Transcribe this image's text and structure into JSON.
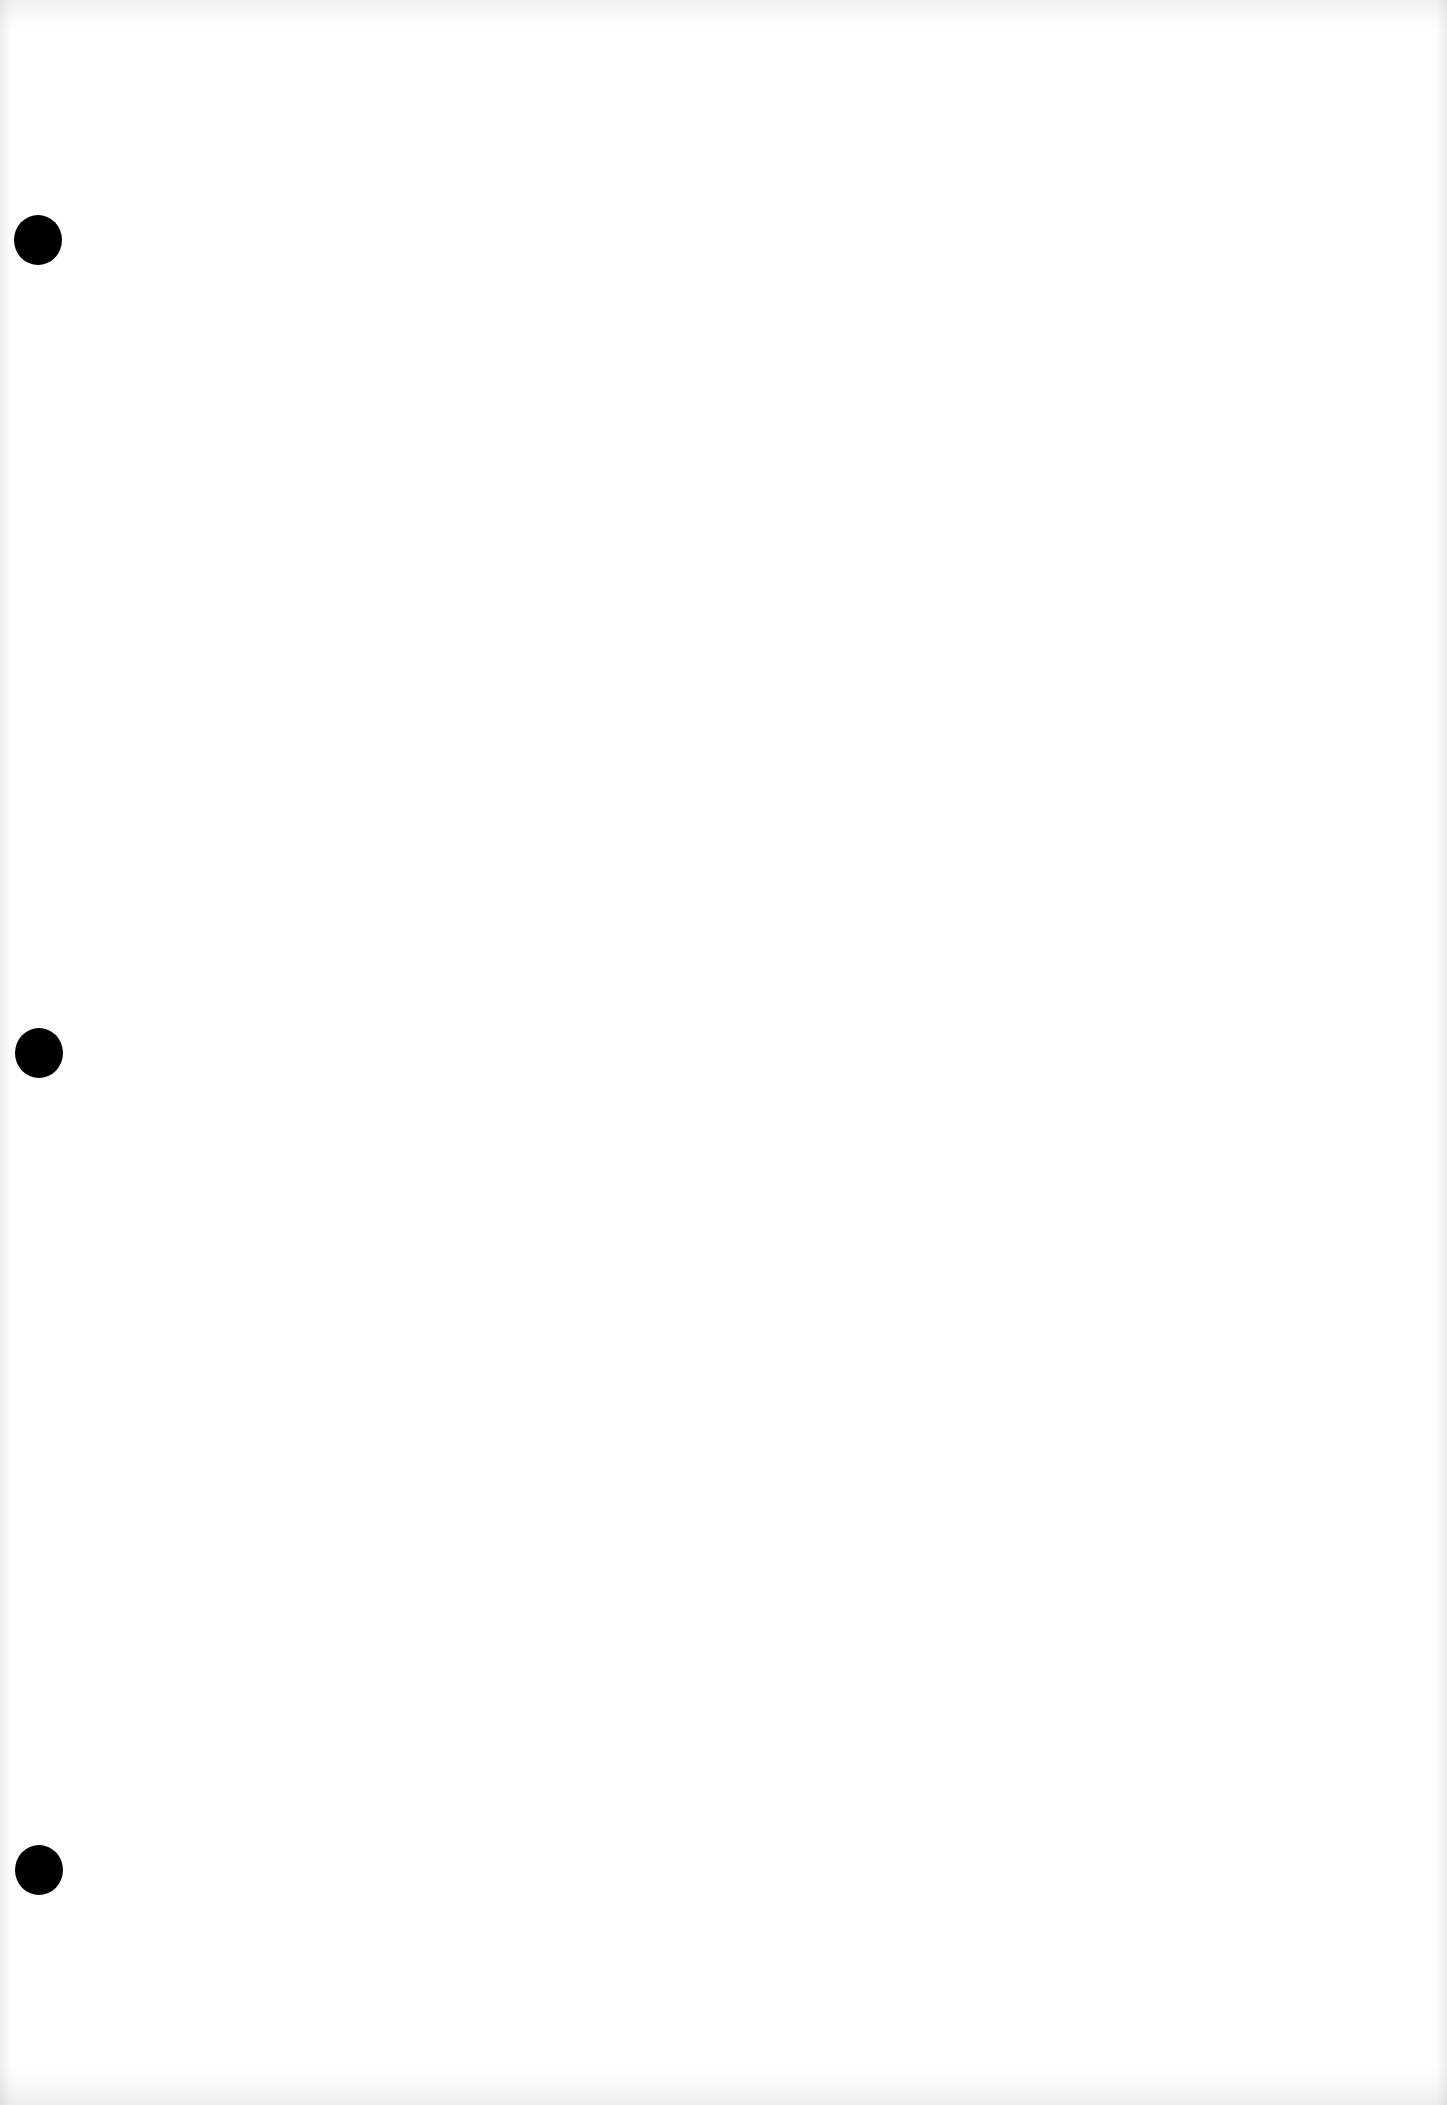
{
  "document": {
    "type": "blank-page",
    "background_color": "#ffffff",
    "punch_holes": [
      {
        "cx": 38,
        "cy": 240,
        "color": "#000000"
      },
      {
        "cx": 39,
        "cy": 1053,
        "color": "#000000"
      },
      {
        "cx": 39,
        "cy": 1870,
        "color": "#000000"
      }
    ]
  }
}
